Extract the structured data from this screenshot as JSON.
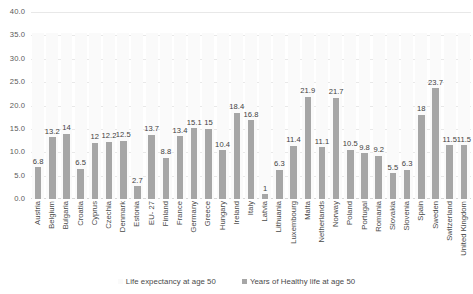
{
  "chart_data": {
    "type": "bar",
    "title": "",
    "xlabel": "",
    "ylabel": "",
    "ylim": [
      0.0,
      40.0
    ],
    "ytick_labels": [
      "0.0",
      "5.0",
      "10.0",
      "15.0",
      "20.0",
      "25.0",
      "30.0",
      "35.0",
      "40.0"
    ],
    "ytick_values": [
      0,
      5,
      10,
      15,
      20,
      25,
      30,
      35,
      40
    ],
    "grid": true,
    "legend_position": "bottom",
    "categories": [
      "Austria",
      "Belgium",
      "Bulgaria",
      "Croatia",
      "Cyprus",
      "Czechia",
      "Denmark",
      "Estonia",
      "EU- 27",
      "Finland",
      "France",
      "Germany",
      "Greece",
      "Hungary",
      "Ireland",
      "Italy",
      "Latvia",
      "Lithuania",
      "Luxembourg",
      "Malta",
      "Netherlands",
      "Norway",
      "Poland",
      "Portugal",
      "Romania",
      "Slovakia",
      "Slovenia",
      "Spain",
      "Sweden",
      "Switzerland",
      "United Kingdom"
    ],
    "series": [
      {
        "name": "Life expectancy at age 50",
        "color": "#fafafa",
        "show_labels": false,
        "values": [
          35.5,
          35.5,
          35.5,
          35.5,
          35.5,
          35.5,
          35.5,
          35.5,
          35.5,
          35.5,
          35.5,
          35.5,
          35.5,
          35.5,
          35.5,
          35.5,
          35.5,
          35.5,
          35.5,
          35.5,
          35.5,
          35.5,
          35.5,
          35.5,
          35.5,
          35.5,
          35.5,
          35.5,
          35.5,
          35.5,
          35.5
        ]
      },
      {
        "name": "Years of Healthy life at age 50",
        "color": "#a6a6a6",
        "show_labels": true,
        "values": [
          6.8,
          13.2,
          14,
          6.5,
          12,
          12.2,
          12.5,
          2.7,
          13.7,
          8.8,
          13.4,
          15.1,
          15,
          10.4,
          18.4,
          16.8,
          1,
          6.3,
          11.4,
          21.9,
          11.1,
          21.7,
          10.5,
          9.8,
          9.2,
          5.5,
          6.3,
          18,
          23.7,
          11.5,
          11.5
        ],
        "value_labels": [
          "6.8",
          "13.2",
          "14",
          "6.5",
          "12",
          "12.2",
          "12.5",
          "2.7",
          "13.7",
          "8.8",
          "13.4",
          "15.1",
          "15",
          "10.4",
          "18.4",
          "16.8",
          "1",
          "6.3",
          "11.4",
          "21.9",
          "11.1",
          "21.7",
          "10.5",
          "9.8",
          "9.2",
          "5.5",
          "6.3",
          "18",
          "23.7",
          "11.5",
          "11.5"
        ]
      }
    ],
    "legend": [
      {
        "label": "Life expectancy at age 50",
        "swatch": "light"
      },
      {
        "label": "Years of Healthy life at age 50",
        "swatch": "dark"
      }
    ]
  }
}
